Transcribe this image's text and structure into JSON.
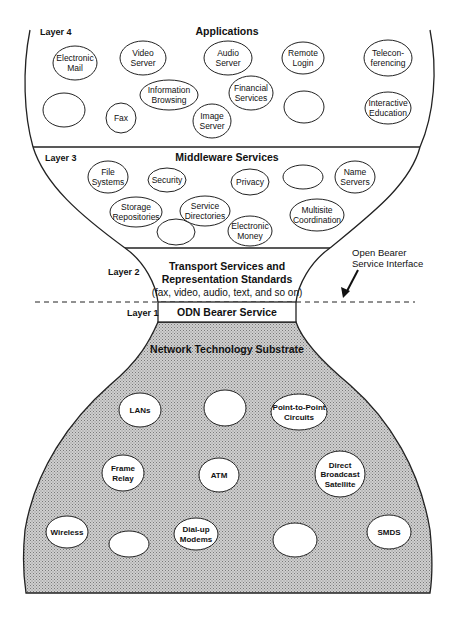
{
  "diagram": {
    "colors": {
      "line": "#222222",
      "substrate_fill": "#bdbdbd",
      "background": "#ffffff"
    },
    "layers": [
      {
        "id": "layer4",
        "layer_label": "Layer 4",
        "title": "Applications",
        "nodes": [
          {
            "lines": [
              "Electronic",
              "Mail"
            ],
            "cx": 75,
            "cy": 63,
            "rx": 22,
            "ry": 17
          },
          {
            "lines": [
              "Video",
              "Server"
            ],
            "cx": 143,
            "cy": 58,
            "rx": 23,
            "ry": 17
          },
          {
            "lines": [
              "Audio",
              "Server"
            ],
            "cx": 228,
            "cy": 58,
            "rx": 24,
            "ry": 17
          },
          {
            "lines": [
              "Remote",
              "Login"
            ],
            "cx": 303,
            "cy": 58,
            "rx": 21,
            "ry": 16
          },
          {
            "lines": [
              "Telecon-",
              "ferencing"
            ],
            "cx": 388,
            "cy": 58,
            "rx": 24,
            "ry": 18
          },
          {
            "lines": [
              "Information",
              "Browsing"
            ],
            "cx": 169,
            "cy": 95,
            "rx": 29,
            "ry": 15
          },
          {
            "lines": [
              "Financial",
              "Services"
            ],
            "cx": 251,
            "cy": 93,
            "rx": 22,
            "ry": 17
          },
          {
            "lines": [],
            "cx": 64,
            "cy": 110,
            "rx": 21,
            "ry": 17
          },
          {
            "lines": [
              "Fax"
            ],
            "cx": 121,
            "cy": 118,
            "rx": 15,
            "ry": 15
          },
          {
            "lines": [
              "Image",
              "Server"
            ],
            "cx": 212,
            "cy": 121,
            "rx": 19,
            "ry": 17
          },
          {
            "lines": [],
            "cx": 304,
            "cy": 107,
            "rx": 20,
            "ry": 16
          },
          {
            "lines": [
              "Interactive",
              "Education"
            ],
            "cx": 388,
            "cy": 108,
            "rx": 23,
            "ry": 16
          }
        ]
      },
      {
        "id": "layer3",
        "layer_label": "Layer 3",
        "title": "Middleware Services",
        "nodes": [
          {
            "lines": [
              "File",
              "Systems"
            ],
            "cx": 108,
            "cy": 177,
            "rx": 20,
            "ry": 16
          },
          {
            "lines": [
              "Security"
            ],
            "cx": 167,
            "cy": 180,
            "rx": 19,
            "ry": 12
          },
          {
            "lines": [
              "Privacy"
            ],
            "cx": 250,
            "cy": 182,
            "rx": 19,
            "ry": 13
          },
          {
            "lines": [],
            "cx": 303,
            "cy": 177,
            "rx": 20,
            "ry": 12
          },
          {
            "lines": [
              "Name",
              "Servers"
            ],
            "cx": 355,
            "cy": 177,
            "rx": 20,
            "ry": 16
          },
          {
            "lines": [
              "Storage",
              "Repositories"
            ],
            "cx": 136,
            "cy": 212,
            "rx": 26,
            "ry": 15
          },
          {
            "lines": [
              "Service",
              "Directories"
            ],
            "cx": 205,
            "cy": 211,
            "rx": 25,
            "ry": 15
          },
          {
            "lines": [
              "Multisite",
              "Coordination"
            ],
            "cx": 317,
            "cy": 215,
            "rx": 27,
            "ry": 16
          },
          {
            "lines": [],
            "cx": 176,
            "cy": 232,
            "rx": 19,
            "ry": 13
          },
          {
            "lines": [
              "Electronic",
              "Money"
            ],
            "cx": 250,
            "cy": 231,
            "rx": 22,
            "ry": 15
          }
        ]
      },
      {
        "id": "layer2",
        "layer_label": "Layer 2",
        "title_lines": [
          "Transport Services and",
          "Representation Standards"
        ],
        "subtitle": "(fax, video, audio, text, and so on)"
      },
      {
        "id": "layer1",
        "layer_label": "Layer 1",
        "title": "ODN Bearer Service"
      },
      {
        "id": "substrate",
        "title": "Network Technology Substrate",
        "nodes": [
          {
            "lines": [
              "LANs"
            ],
            "cx": 140,
            "cy": 410,
            "rx": 21,
            "ry": 17
          },
          {
            "lines": [],
            "cx": 225,
            "cy": 408,
            "rx": 21,
            "ry": 18
          },
          {
            "lines": [
              "Point-to-Point",
              "Circuits"
            ],
            "cx": 299,
            "cy": 412,
            "rx": 28,
            "ry": 18
          },
          {
            "lines": [
              "Frame",
              "Relay"
            ],
            "cx": 123,
            "cy": 473,
            "rx": 21,
            "ry": 18
          },
          {
            "lines": [
              "ATM"
            ],
            "cx": 219,
            "cy": 475,
            "rx": 20,
            "ry": 17
          },
          {
            "lines": [
              "Direct",
              "Broadcast",
              "Satellite"
            ],
            "cx": 340,
            "cy": 474,
            "rx": 25,
            "ry": 23
          },
          {
            "lines": [
              "Wireless"
            ],
            "cx": 67,
            "cy": 532,
            "rx": 21,
            "ry": 16
          },
          {
            "lines": [],
            "cx": 129,
            "cy": 544,
            "rx": 20,
            "ry": 13
          },
          {
            "lines": [
              "Dial-up",
              "Modems"
            ],
            "cx": 196,
            "cy": 534,
            "rx": 22,
            "ry": 16
          },
          {
            "lines": [],
            "cx": 295,
            "cy": 540,
            "rx": 22,
            "ry": 17
          },
          {
            "lines": [
              "SMDS"
            ],
            "cx": 389,
            "cy": 532,
            "rx": 22,
            "ry": 17
          }
        ]
      }
    ],
    "annotation": {
      "lines": [
        "Open Bearer",
        "Service Interface"
      ]
    }
  }
}
